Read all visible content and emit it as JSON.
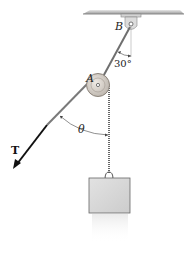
{
  "diagram": {
    "type": "pulley-system",
    "labels": {
      "support_point": "B",
      "pulley": "A",
      "angle_support": "30°",
      "angle_theta": "θ",
      "tension": "T"
    },
    "colors": {
      "ceiling": "#a9a9a9",
      "bracket": "#d8d8d8",
      "pulley": "#cfc9c2",
      "rope": "#777777",
      "arrow": "#111111",
      "block": "#d6d6d6",
      "block_border": "#666666"
    }
  }
}
